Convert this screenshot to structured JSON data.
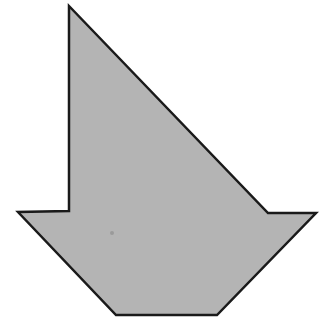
{
  "diagram": {
    "type": "polygon",
    "shape_name": "arrow-like polygon pointing down",
    "canvas": {
      "width": 331,
      "height": 333,
      "background": "#ffffff"
    },
    "polygon": {
      "fill": "#b4b4b4",
      "stroke": "#1a1a1a",
      "stroke_width": 2.5,
      "points": [
        [
          69,
          6
        ],
        [
          268,
          213
        ],
        [
          316,
          213
        ],
        [
          217,
          315
        ],
        [
          116,
          315
        ],
        [
          18,
          212
        ],
        [
          69,
          211
        ]
      ]
    },
    "speck": {
      "cx": 112,
      "cy": 233,
      "r": 2,
      "fill": "#9a9a9a"
    }
  }
}
